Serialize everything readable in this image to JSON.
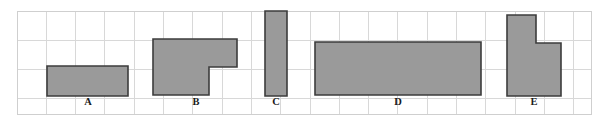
{
  "diagram": {
    "type": "grid-shapes",
    "canvas": {
      "width": 599,
      "height": 129
    },
    "colors": {
      "background": "#ffffff",
      "shape_fill": "#9a9a9a",
      "shape_stroke": "#3c3c3c",
      "grid_line": "#d8d8d8",
      "grid_border": "#cfcfcf",
      "label_text": "#1a1a1a"
    },
    "grid": {
      "origin_x": 17,
      "origin_y": 11,
      "cell_width": 29.3,
      "cell_height": 29.3,
      "columns": 19.6,
      "rows": 3.5,
      "right": 591,
      "bottom": 114,
      "visible": true
    },
    "shapes": [
      {
        "label": "A",
        "kind": "rectangle",
        "grid_cells": 3,
        "label_x": 88,
        "label_y": 103,
        "points": "47,66 128,66 128,96 47,96"
      },
      {
        "label": "B",
        "kind": "l-shape",
        "grid_cells": 5,
        "label_x": 196,
        "label_y": 103,
        "points": "153,39 237,39 237,67 209,67 209,95 153,95"
      },
      {
        "label": "C",
        "kind": "rectangle",
        "grid_cells": 3,
        "label_x": 276,
        "label_y": 103,
        "points": "265,11 287,11 287,96 265,96"
      },
      {
        "label": "D",
        "kind": "rectangle",
        "grid_cells": 10,
        "label_x": 398,
        "label_y": 103,
        "points": "315,42 481,42 481,95 315,95"
      },
      {
        "label": "E",
        "kind": "l-shape",
        "grid_cells": 5,
        "label_x": 534,
        "label_y": 103,
        "points": "507,15 536,15 536,43 561,43 561,96 507,96"
      }
    ],
    "labels": [
      "A",
      "B",
      "C",
      "D",
      "E"
    ]
  }
}
